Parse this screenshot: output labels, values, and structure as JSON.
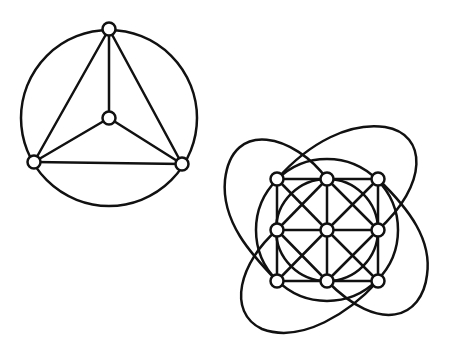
{
  "diagram": {
    "type": "graph-drawings",
    "colors": {
      "background": "#ffffff",
      "stroke": "#111111",
      "node_fill": "#ffffff"
    },
    "node_radius": 6.5,
    "graphs": [
      {
        "id": "k4-in-circle",
        "description": "K4 drawn as a triangle with center vertex, outer vertices on a circle",
        "circle": {
          "cx": 109,
          "cy": 118,
          "r": 88
        },
        "nodes": [
          {
            "id": "top",
            "x": 109,
            "y": 29
          },
          {
            "id": "left",
            "x": 34,
            "y": 162
          },
          {
            "id": "right",
            "x": 182,
            "y": 164
          },
          {
            "id": "center",
            "x": 109,
            "y": 118
          }
        ],
        "edges": [
          [
            "top",
            "left"
          ],
          [
            "top",
            "right"
          ],
          [
            "left",
            "right"
          ],
          [
            "top",
            "center"
          ],
          [
            "left",
            "center"
          ],
          [
            "right",
            "center"
          ]
        ]
      },
      {
        "id": "grid-3x3-king-graph",
        "description": "3x3 grid with diagonals, inscribed circle, circumscribed circle and four looping curved edges",
        "inner_circle": {
          "cx": 327,
          "cy": 230,
          "r": 51
        },
        "outer_circle": {
          "cx": 327,
          "cy": 230,
          "r": 71
        },
        "nodes": [
          {
            "id": "TL",
            "x": 277,
            "y": 179
          },
          {
            "id": "TM",
            "x": 327,
            "y": 179
          },
          {
            "id": "TR",
            "x": 378,
            "y": 179
          },
          {
            "id": "ML",
            "x": 277,
            "y": 230
          },
          {
            "id": "MM",
            "x": 327,
            "y": 230
          },
          {
            "id": "MR",
            "x": 378,
            "y": 230
          },
          {
            "id": "BL",
            "x": 277,
            "y": 281
          },
          {
            "id": "BM",
            "x": 327,
            "y": 281
          },
          {
            "id": "BR",
            "x": 378,
            "y": 281
          }
        ],
        "edges": [
          [
            "TL",
            "TM"
          ],
          [
            "TM",
            "TR"
          ],
          [
            "ML",
            "MM"
          ],
          [
            "MM",
            "MR"
          ],
          [
            "BL",
            "BM"
          ],
          [
            "BM",
            "BR"
          ],
          [
            "TL",
            "ML"
          ],
          [
            "ML",
            "BL"
          ],
          [
            "TM",
            "MM"
          ],
          [
            "MM",
            "BM"
          ],
          [
            "TR",
            "MR"
          ],
          [
            "MR",
            "BR"
          ],
          [
            "TL",
            "MM"
          ],
          [
            "MM",
            "BR"
          ],
          [
            "TR",
            "MM"
          ],
          [
            "MM",
            "BL"
          ],
          [
            "TM",
            "ML"
          ],
          [
            "TM",
            "MR"
          ],
          [
            "ML",
            "BM"
          ],
          [
            "MR",
            "BM"
          ]
        ],
        "curved_edges": [
          {
            "id": "nw-loop",
            "from": "TM",
            "to": "BL",
            "path": "M327,179 C295,135 232,118 225,180 C221,222 252,255 277,281"
          },
          {
            "id": "se-loop",
            "from": "TR",
            "to": "BM",
            "path": "M378,179 C410,210 432,240 427,275 C422,318 380,335 327,281"
          },
          {
            "id": "ne-loop",
            "from": "TL",
            "to": "MR",
            "path": "M277,179 C310,142 350,122 385,127 C428,134 428,185 378,230"
          },
          {
            "id": "sw-loop",
            "from": "ML",
            "to": "BR",
            "path": "M277,230 C240,262 226,312 262,329 C302,344 350,312 378,281"
          }
        ]
      }
    ]
  }
}
